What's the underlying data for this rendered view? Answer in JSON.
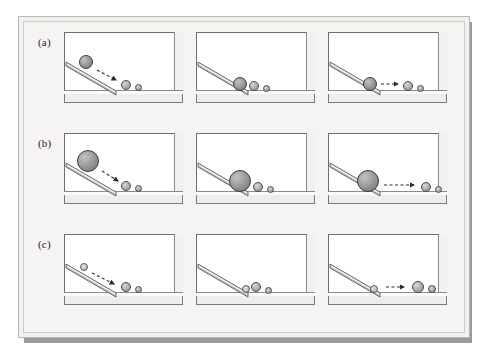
{
  "figure": {
    "caption_labels": [
      "(a)",
      "(b)",
      "(c)"
    ],
    "columns": 3,
    "rows": 3,
    "colors": {
      "plate_background": "#f5f4f2",
      "panel_background": "#ffffff",
      "panel_border": "#6e6e6e",
      "shadow": "#9a9a9a",
      "ball_fill": "#b4b4b4",
      "ball_outline": "#4a4a4a",
      "ramp_fill": "#e8e8e8",
      "ramp_outline": "#555555"
    }
  },
  "chart_data": {
    "type": "diagram-sequence",
    "title": "",
    "rows": [
      {
        "label": "(a)",
        "rolling_ball_radius": 7,
        "release_height": "high",
        "frames": [
          {
            "stage": "rolling-down",
            "rolling_ball": {
              "x": 22,
              "y": 30,
              "r": 7,
              "shade": "dark"
            },
            "targets": [
              {
                "x": 62,
                "y": 53,
                "r": 5
              },
              {
                "x": 74,
                "y": 55,
                "r": 3.5
              }
            ],
            "arrow": {
              "x1": 33,
              "y1": 38,
              "x2": 52,
              "y2": 48,
              "dashed": true
            }
          },
          {
            "stage": "impact",
            "rolling_ball": {
              "x": 44,
              "y": 52,
              "r": 7,
              "shade": "dark"
            },
            "targets": [
              {
                "x": 58,
                "y": 54,
                "r": 5
              },
              {
                "x": 70,
                "y": 56,
                "r": 3.5
              }
            ],
            "arrow": null
          },
          {
            "stage": "after-collision",
            "rolling_ball": {
              "x": 42,
              "y": 52,
              "r": 7,
              "shade": "dark"
            },
            "targets": [
              {
                "x": 80,
                "y": 54,
                "r": 5
              },
              {
                "x": 92,
                "y": 56,
                "r": 3.5
              }
            ],
            "arrow": {
              "x1": 53,
              "y1": 52,
              "x2": 70,
              "y2": 52,
              "dashed": true
            }
          }
        ]
      },
      {
        "label": "(b)",
        "rolling_ball_radius": 11,
        "release_height": "high",
        "frames": [
          {
            "stage": "rolling-down",
            "rolling_ball": {
              "x": 24,
              "y": 28,
              "r": 11,
              "shade": "dark"
            },
            "targets": [
              {
                "x": 62,
                "y": 53,
                "r": 5
              },
              {
                "x": 74,
                "y": 55,
                "r": 3.5
              }
            ],
            "arrow": {
              "x1": 38,
              "y1": 38,
              "x2": 54,
              "y2": 48,
              "dashed": true
            }
          },
          {
            "stage": "impact",
            "rolling_ball": {
              "x": 44,
              "y": 48,
              "r": 11,
              "shade": "dark"
            },
            "targets": [
              {
                "x": 62,
                "y": 54,
                "r": 5
              },
              {
                "x": 74,
                "y": 56,
                "r": 3.5
              }
            ],
            "arrow": null
          },
          {
            "stage": "after-collision",
            "rolling_ball": {
              "x": 40,
              "y": 48,
              "r": 11,
              "shade": "dark"
            },
            "targets": [
              {
                "x": 98,
                "y": 54,
                "r": 5
              },
              {
                "x": 110,
                "y": 56,
                "r": 3.5
              }
            ],
            "arrow": {
              "x1": 56,
              "y1": 52,
              "x2": 86,
              "y2": 52,
              "dashed": true
            }
          }
        ]
      },
      {
        "label": "(c)",
        "rolling_ball_radius": 4,
        "release_height": "high",
        "frames": [
          {
            "stage": "rolling-down",
            "rolling_ball": {
              "x": 20,
              "y": 33,
              "r": 4,
              "shade": "light"
            },
            "targets": [
              {
                "x": 62,
                "y": 53,
                "r": 5
              },
              {
                "x": 74,
                "y": 55,
                "r": 3.5
              }
            ],
            "arrow": {
              "x1": 28,
              "y1": 39,
              "x2": 50,
              "y2": 50,
              "dashed": true
            }
          },
          {
            "stage": "impact",
            "rolling_ball": {
              "x": 50,
              "y": 55,
              "r": 4,
              "shade": "light"
            },
            "targets": [
              {
                "x": 60,
                "y": 53,
                "r": 5
              },
              {
                "x": 72,
                "y": 56,
                "r": 3.5
              }
            ],
            "arrow": null
          },
          {
            "stage": "after-collision",
            "rolling_ball": {
              "x": 46,
              "y": 55,
              "r": 4,
              "shade": "light"
            },
            "targets": [
              {
                "x": 90,
                "y": 53,
                "r": 6
              },
              {
                "x": 104,
                "y": 55,
                "r": 4
              }
            ],
            "arrow": {
              "x1": 58,
              "y1": 53,
              "x2": 76,
              "y2": 53,
              "dashed": true
            }
          }
        ]
      }
    ]
  }
}
